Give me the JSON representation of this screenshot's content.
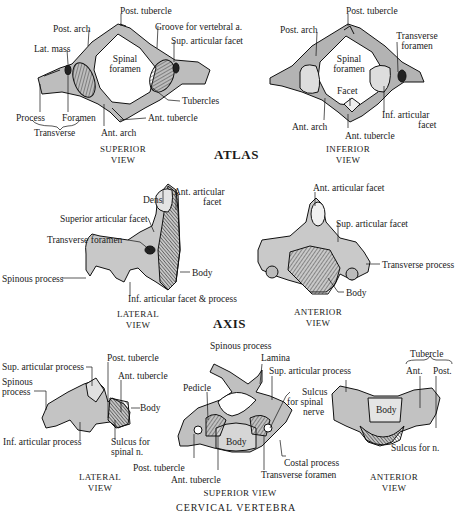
{
  "figure": {
    "sections": [
      {
        "title": "ATLAS",
        "views": [
          {
            "caption": [
              "SUPERIOR",
              "VIEW"
            ],
            "labels": [
              "Post. tubercle",
              "Post. arch",
              "Groove for vertebral a.",
              "Sup. articular facet",
              "Lat. mass",
              "Spinal",
              "foramen",
              "Tubercles",
              "Process",
              "Foramen",
              "Transverse",
              "Ant. arch",
              "Ant. tubercle"
            ]
          },
          {
            "caption": [
              "INFERIOR",
              "VIEW"
            ],
            "labels": [
              "Post. tubercle",
              "Post. arch",
              "Transverse",
              "foramen",
              "Spinal",
              "foramen",
              "Facet",
              "Inf. articular",
              "facet",
              "Ant. arch",
              "Ant. tubercle"
            ]
          }
        ]
      },
      {
        "title": "AXIS",
        "views": [
          {
            "caption": [
              "LATERAL",
              "VIEW"
            ],
            "labels": [
              "Dens",
              "Ant. articular",
              "facet",
              "Superior articular facet",
              "Transverse foramen",
              "Spinous process",
              "Body",
              "Inf. articular facet & process"
            ]
          },
          {
            "caption": [
              "ANTERIOR",
              "VIEW"
            ],
            "labels": [
              "Ant. articular facet",
              "Sup. articular facet",
              "Transverse process",
              "Body"
            ]
          }
        ]
      },
      {
        "title": "CERVICAL VERTEBRA",
        "views": [
          {
            "caption": [
              "LATERAL",
              "VIEW"
            ],
            "labels": [
              "Sup. articular process",
              "Spinous",
              "process",
              "Post. tubercle",
              "Ant. tubercle",
              "Body",
              "Inf. articular process",
              "Sulcus for",
              "spinal n."
            ]
          },
          {
            "caption": [
              "SUPERIOR  VIEW"
            ],
            "labels": [
              "Spinous process",
              "Lamina",
              "Sup. articular process",
              "Pedicle",
              "Sulcus",
              "for spinal",
              "nerve",
              "Body",
              "Post. tubercle",
              "Costal process",
              "Ant. tubercle",
              "Transverse foramen"
            ]
          },
          {
            "caption": [
              "ANTERIOR",
              "VIEW"
            ],
            "labels": [
              "Tubercle",
              "Ant.",
              "Post.",
              "Body",
              "Sulcus for n."
            ]
          }
        ]
      }
    ]
  }
}
